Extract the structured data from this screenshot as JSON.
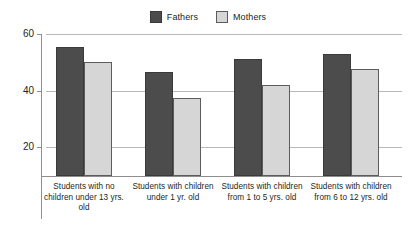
{
  "chart_data": {
    "type": "bar",
    "title": "",
    "subtitle": "",
    "xlabel": "",
    "ylabel": "",
    "grid": true,
    "legend_position": "top-center",
    "ylim": [
      10,
      60
    ],
    "yticks": [
      20,
      40,
      60
    ],
    "ytick_labels": [
      "20",
      "40",
      "60"
    ],
    "categories": [
      "Students with no children under 13 yrs. old",
      "Students with children under 1 yr. old",
      "Students with children from 1 to 5 yrs. old",
      "Students with children from 6 to 12 yrs. old"
    ],
    "category_lines": [
      [
        "Students with no",
        "children under 13 yrs.",
        "old"
      ],
      [
        "Students with children",
        "under 1 yr. old"
      ],
      [
        "Students with children",
        "from 1 to 5 yrs. old"
      ],
      [
        "Students with children",
        "from 6 to 12 yrs. old"
      ]
    ],
    "series": [
      {
        "name": "Fathers",
        "color": "#4c4c4c",
        "values": [
          55.5,
          46.5,
          51.0,
          52.8
        ]
      },
      {
        "name": "Mothers",
        "color": "#d6d6d6",
        "values": [
          50.0,
          37.5,
          42.0,
          47.5
        ]
      }
    ]
  },
  "legend": {
    "entries": [
      {
        "label": "Fathers",
        "swatch": "legend-swatch-fathers"
      },
      {
        "label": "Mothers",
        "swatch": "legend-swatch-mothers"
      }
    ]
  },
  "colors": {
    "fathers": "#4c4c4c",
    "mothers": "#d6d6d6",
    "gridline": "#b9b9b9",
    "axis": "#8e8e8e",
    "text": "#231f20",
    "background": "#ffffff"
  }
}
